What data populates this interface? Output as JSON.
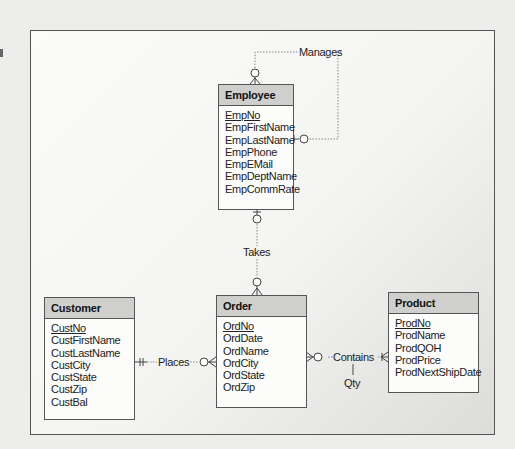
{
  "diagram": {
    "type": "entity-relationship (crow's foot)",
    "entities": [
      {
        "name": "Employee",
        "attributes": [
          {
            "name": "EmpNo",
            "pk": true
          },
          {
            "name": "EmpFirstName"
          },
          {
            "name": "EmpLastName"
          },
          {
            "name": "EmpPhone"
          },
          {
            "name": "EmpEMail"
          },
          {
            "name": "EmpDeptName"
          },
          {
            "name": "EmpCommRate"
          }
        ]
      },
      {
        "name": "Customer",
        "attributes": [
          {
            "name": "CustNo",
            "pk": true
          },
          {
            "name": "CustFirstName"
          },
          {
            "name": "CustLastName"
          },
          {
            "name": "CustCity"
          },
          {
            "name": "CustState"
          },
          {
            "name": "CustZip"
          },
          {
            "name": "CustBal"
          }
        ]
      },
      {
        "name": "Order",
        "attributes": [
          {
            "name": "OrdNo",
            "pk": true
          },
          {
            "name": "OrdDate"
          },
          {
            "name": "OrdName"
          },
          {
            "name": "OrdCity"
          },
          {
            "name": "OrdState"
          },
          {
            "name": "OrdZip"
          }
        ]
      },
      {
        "name": "Product",
        "attributes": [
          {
            "name": "ProdNo",
            "pk": true
          },
          {
            "name": "ProdName"
          },
          {
            "name": "ProdQOH"
          },
          {
            "name": "ProdPrice"
          },
          {
            "name": "ProdNextShipDate"
          }
        ]
      }
    ],
    "relationships": [
      {
        "label": "Manages",
        "from": "Employee",
        "to": "Employee",
        "from_card": "zero-or-one",
        "to_card": "zero-or-many"
      },
      {
        "label": "Takes",
        "from": "Employee",
        "to": "Order",
        "from_card": "zero-or-one",
        "to_card": "zero-or-many"
      },
      {
        "label": "Places",
        "from": "Customer",
        "to": "Order",
        "from_card": "exactly-one",
        "to_card": "zero-or-many"
      },
      {
        "label": "Contains",
        "from": "Order",
        "to": "Product",
        "from_card": "zero-or-many",
        "to_card": "one-or-many",
        "attribute": "Qty"
      }
    ]
  },
  "labels": {
    "manages": "Manages",
    "takes": "Takes",
    "places": "Places",
    "contains": "Contains",
    "qty": "Qty"
  }
}
